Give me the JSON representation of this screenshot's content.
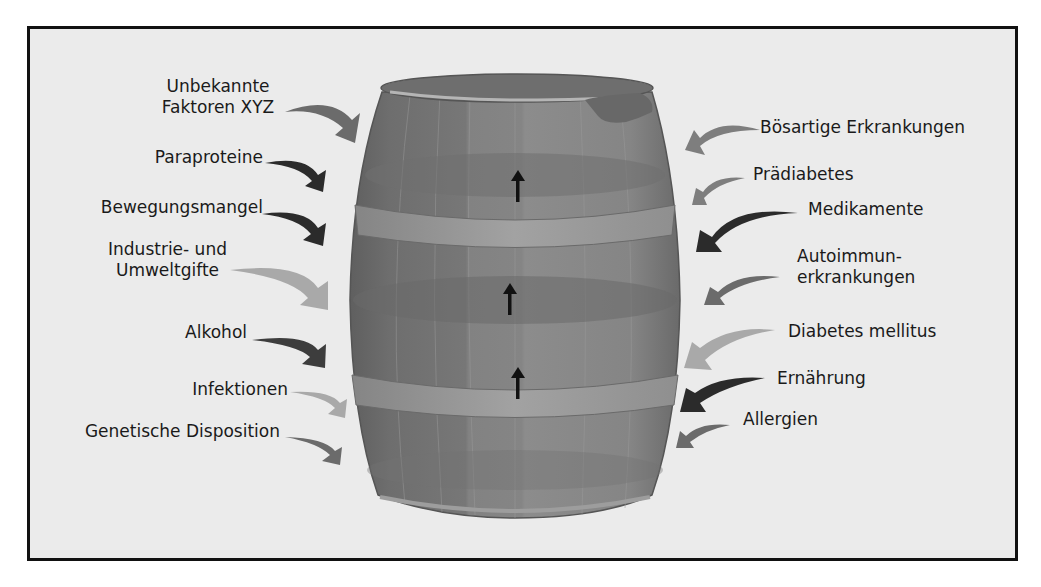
{
  "diagram": {
    "type": "barrel-risk-factors",
    "colors": {
      "background": "#ebebeb",
      "frame": "#111111",
      "barrel_body": "#7b7b7b",
      "barrel_dark": "#686868",
      "barrel_light": "#8a8a8a",
      "barrel_band": "#9c9c9c",
      "arrow_dark": "#2b2b2b",
      "arrow_medium": "#6b6b6b",
      "arrow_light": "#a9a9a9",
      "level_arrow": "#111111"
    },
    "left_factors": [
      {
        "line1": "Unbekannte",
        "line2": "Faktoren XYZ",
        "shade": "medium"
      },
      {
        "line1": "Paraproteine",
        "shade": "dark"
      },
      {
        "line1": "Bewegungsmangel",
        "shade": "dark"
      },
      {
        "line1": "Industrie- und",
        "line2": "Umweltgifte",
        "shade": "light"
      },
      {
        "line1": "Alkohol",
        "shade": "dark"
      },
      {
        "line1": "Infektionen",
        "shade": "light"
      },
      {
        "line1": "Genetische Disposition",
        "shade": "medium"
      }
    ],
    "right_factors": [
      {
        "line1": "Bösartige Erkrankungen",
        "shade": "medium"
      },
      {
        "line1": "Prädiabetes",
        "shade": "medium"
      },
      {
        "line1": "Medikamente",
        "shade": "dark"
      },
      {
        "line1": "Autoimmun-",
        "line2": "erkrankungen",
        "shade": "medium"
      },
      {
        "line1": "Diabetes mellitus",
        "shade": "light"
      },
      {
        "line1": "Ernährung",
        "shade": "dark"
      },
      {
        "line1": "Allergien",
        "shade": "medium"
      }
    ],
    "level_arrows": 3
  }
}
